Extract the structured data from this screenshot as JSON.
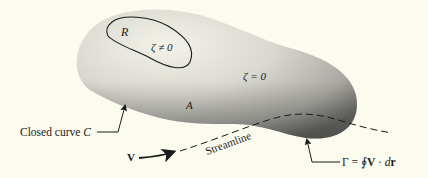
{
  "diagram": {
    "type": "fluid-circulation-illustration",
    "background_color": "#fcfbf0",
    "region_A": {
      "label": "A",
      "vorticity_label": "ζ = 0"
    },
    "region_R": {
      "label": "R",
      "vorticity_label": "ζ ≠ 0"
    },
    "closed_curve": {
      "label": "Closed curve C"
    },
    "streamline": {
      "label": "Streamline"
    },
    "velocity": {
      "label": "V"
    },
    "circulation": {
      "formula": "Γ = ∮V · dr",
      "gamma": "Γ",
      "equals": " = ",
      "integral": "∮",
      "vector": "V",
      "dot": " · ",
      "d": "d",
      "r": "r"
    }
  }
}
